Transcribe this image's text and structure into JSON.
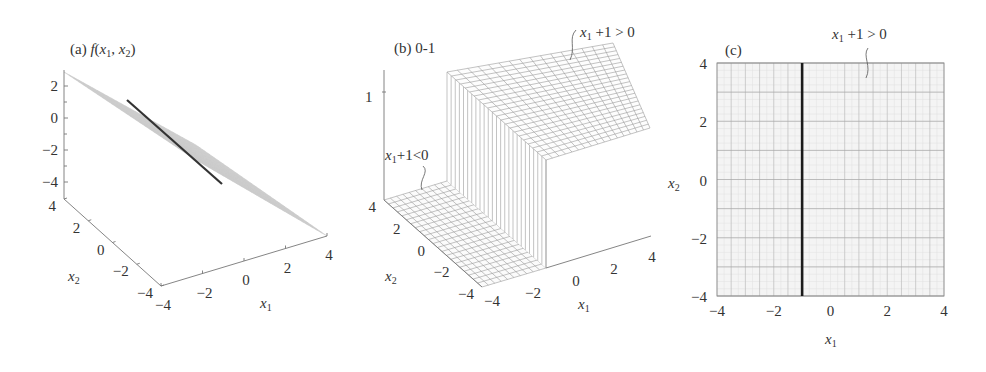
{
  "chart_data": [
    {
      "panel": "a",
      "type": "surface3d",
      "title": "(a) f(x1, x2)",
      "title_parts": {
        "prefix": "(a) ",
        "func": "f",
        "args": "(x1, x2)"
      },
      "xlabel": "x1",
      "ylabel": "x2",
      "zlabel": "",
      "x_ticks": [
        -4,
        -2,
        0,
        2,
        4
      ],
      "y_ticks": [
        -4,
        -2,
        0,
        2,
        4
      ],
      "z_ticks": [
        -4,
        -2,
        0,
        2
      ],
      "x_range": [
        -4,
        4
      ],
      "y_range": [
        -4,
        4
      ],
      "z_range": [
        -5,
        3
      ],
      "surface": "plane f(x1,x2) = -(x1 + 1) (tilted mesh)",
      "highlight_line": {
        "description": "zero contour x1 + 1 = 0",
        "x1": -1
      }
    },
    {
      "panel": "b",
      "type": "surface3d",
      "title": "(b) 0-1",
      "xlabel": "x1",
      "ylabel": "x2",
      "x_ticks": [
        -4,
        -2,
        0,
        2,
        4
      ],
      "y_ticks": [
        -4,
        -2,
        0,
        2,
        4
      ],
      "z_ticks": [
        1
      ],
      "x_range": [
        -4,
        4
      ],
      "y_range": [
        -4,
        4
      ],
      "z_range": [
        0,
        1
      ],
      "surface": "step function: 0 where x1 + 1 < 0, 1 where x1 + 1 > 0",
      "step_at_x1": -1,
      "annotations": [
        {
          "text_var": "x1",
          "text_rest": "+1<0",
          "region": "low"
        },
        {
          "text_var": "x1",
          "text_rest": " +1 > 0",
          "region": "high"
        }
      ]
    },
    {
      "panel": "c",
      "type": "region2d",
      "title": "(c)",
      "xlabel": "x1",
      "ylabel": "x2",
      "x_ticks": [
        -4,
        -2,
        0,
        2,
        4
      ],
      "y_ticks": [
        -4,
        -2,
        0,
        2,
        4
      ],
      "xlim": [
        -4,
        4
      ],
      "ylim": [
        -4,
        4
      ],
      "grid": true,
      "boundary_line": {
        "x1": -1,
        "description": "x1 + 1 = 0"
      },
      "annotations": [
        {
          "text_var": "x1",
          "text_rest": " +1 > 0",
          "region": "right of boundary"
        }
      ]
    }
  ]
}
